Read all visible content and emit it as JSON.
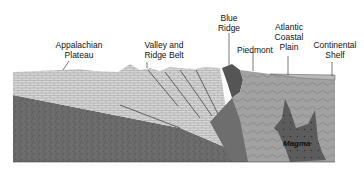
{
  "diagram": {
    "labels": {
      "appalachian_plateau": "Appalachian\nPlateau",
      "valley_ridge": "Valley and\nRidge Belt",
      "blue_ridge": "Blue\nRidge",
      "piedmont": "Piedmont",
      "atlantic_coastal_plain": "Atlantic\nCoastal\nPlain",
      "continental_shelf": "Continental\nShelf",
      "magma": "Magma"
    },
    "colors": {
      "sedimentary_light": "#d4d4d4",
      "basement_dark": "#6a6a6a",
      "piedmont_gray": "#9a9a9a",
      "blue_ridge_dark": "#555555",
      "magma_dark": "#5e5e5e",
      "shelf_layer": "#b8b8b8"
    }
  }
}
